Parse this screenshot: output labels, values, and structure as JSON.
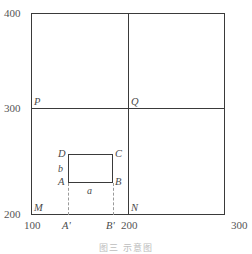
{
  "figure": {
    "caption": "图三  示意图",
    "y_axis": {
      "ticks": [
        {
          "value": "400"
        },
        {
          "value": "300"
        },
        {
          "value": "200"
        }
      ]
    },
    "x_axis": {
      "ticks": [
        {
          "value": "100"
        },
        {
          "value": "A'"
        },
        {
          "value": "B'"
        },
        {
          "value": "200"
        },
        {
          "value": "300"
        }
      ]
    },
    "grid_labels": {
      "p": "P",
      "q": "Q",
      "m": "M",
      "n": "N"
    },
    "rectangle": {
      "vertex_d": "D",
      "vertex_c": "C",
      "vertex_a": "A",
      "vertex_b": "B",
      "side_a": "a",
      "side_b": "b"
    }
  },
  "chart_data": {
    "type": "scatter",
    "title": "",
    "xlabel": "",
    "ylabel": "",
    "xlim": [
      100,
      300
    ],
    "ylim": [
      200,
      400
    ],
    "grid": true,
    "xticks": [
      100,
      200,
      300
    ],
    "yticks": [
      200,
      300,
      400
    ],
    "xtick_labels": [
      "100",
      "A'",
      "B'",
      "200",
      "300"
    ],
    "ytick_labels": [
      "400",
      "300",
      "200"
    ],
    "annotations": [
      {
        "label": "P",
        "x": 100,
        "y": 300
      },
      {
        "label": "Q",
        "x": 200,
        "y": 300
      },
      {
        "label": "M",
        "x": 100,
        "y": 200
      },
      {
        "label": "N",
        "x": 200,
        "y": 200
      },
      {
        "label": "D",
        "x": 138,
        "y": 262
      },
      {
        "label": "C",
        "x": 185,
        "y": 262
      },
      {
        "label": "A",
        "x": 138,
        "y": 232
      },
      {
        "label": "B",
        "x": 185,
        "y": 232
      },
      {
        "label": "a",
        "x": 161,
        "y": 228
      },
      {
        "label": "b",
        "x": 134,
        "y": 247
      },
      {
        "label": "A'",
        "x": 138,
        "y": 200
      },
      {
        "label": "B'",
        "x": 185,
        "y": 200
      }
    ],
    "shapes": [
      {
        "kind": "rect",
        "x0": 100,
        "y0": 200,
        "x1": 300,
        "y1": 400,
        "style": "solid"
      },
      {
        "kind": "line",
        "x0": 200,
        "y0": 200,
        "x1": 200,
        "y1": 400,
        "style": "solid"
      },
      {
        "kind": "line",
        "x0": 100,
        "y0": 300,
        "x1": 300,
        "y1": 300,
        "style": "solid"
      },
      {
        "kind": "rect",
        "x0": 138,
        "y0": 232,
        "x1": 185,
        "y1": 262,
        "style": "solid"
      },
      {
        "kind": "line",
        "x0": 138,
        "y0": 200,
        "x1": 138,
        "y1": 232,
        "style": "dashed"
      },
      {
        "kind": "line",
        "x0": 185,
        "y0": 200,
        "x1": 185,
        "y1": 232,
        "style": "dashed"
      }
    ]
  }
}
